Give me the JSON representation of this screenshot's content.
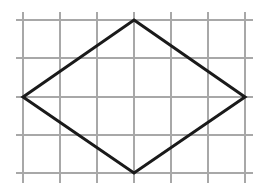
{
  "diagram": {
    "type": "grid-with-rhombus",
    "grid": {
      "columns": 6,
      "rows": 4,
      "vertical_lines_x": [
        23,
        60,
        97,
        134,
        171,
        208,
        245
      ],
      "horizontal_lines_y": [
        20,
        58,
        97,
        135,
        173
      ],
      "line_color": "#a8a8a8",
      "h_extent": [
        16,
        253
      ],
      "v_extent": [
        12,
        183
      ]
    },
    "rhombus": {
      "vertices": {
        "top": [
          134,
          20
        ],
        "right": [
          245,
          97
        ],
        "bottom": [
          134,
          173
        ],
        "left": [
          23,
          97
        ]
      },
      "grid_vertices": {
        "top": [
          3,
          0
        ],
        "right": [
          6,
          2
        ],
        "bottom": [
          3,
          4
        ],
        "left": [
          0,
          2
        ]
      },
      "stroke_color": "#1a1a1a",
      "stroke_width": 3
    }
  }
}
